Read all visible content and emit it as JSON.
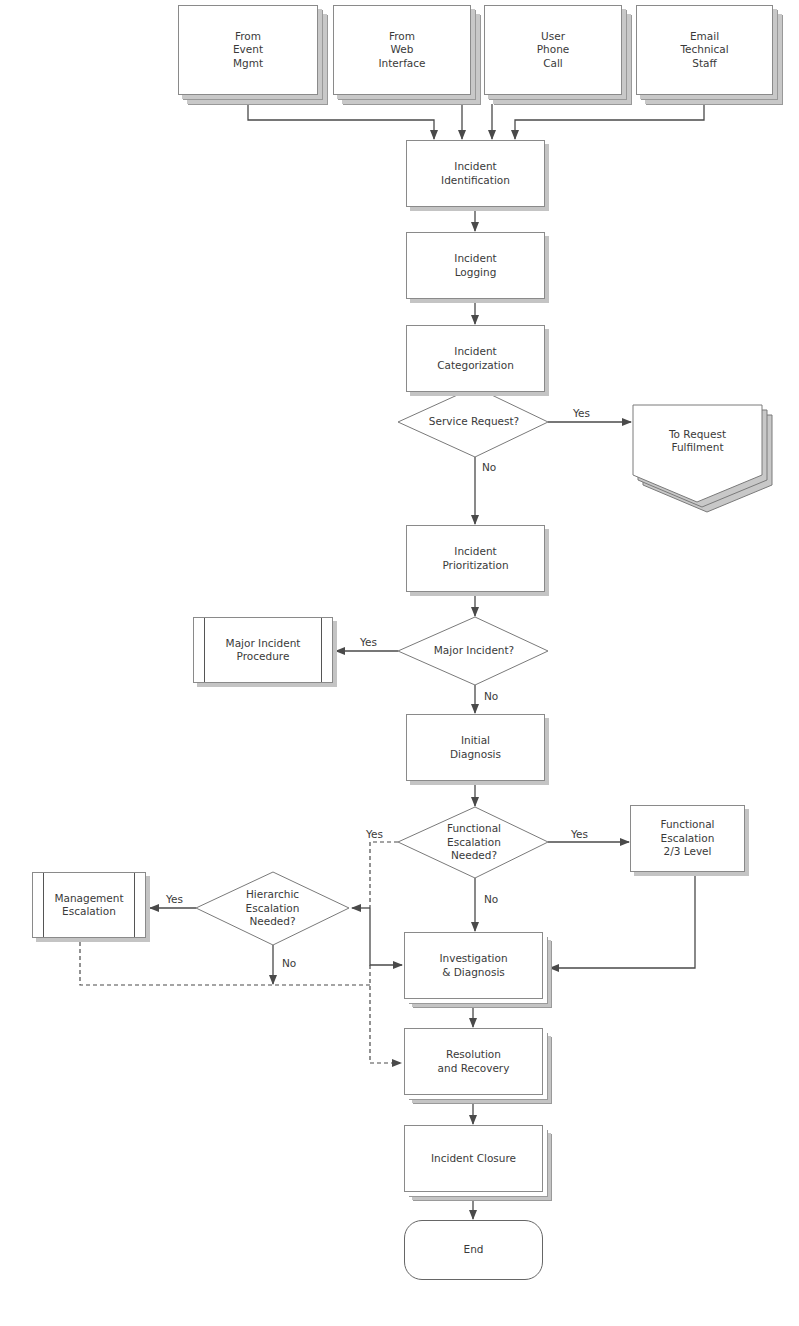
{
  "heading_fragment": "… ________ _ ___ …",
  "colors": {
    "line": "#4a4a4a",
    "border": "#8a8a8a",
    "shadow": "#c4c4c4",
    "text": "#3a3a3a"
  },
  "inputs": [
    {
      "id": "event",
      "label": "From\nEvent\nMgmt"
    },
    {
      "id": "web",
      "label": "From\nWeb\nInterface"
    },
    {
      "id": "phone",
      "label": "User\nPhone\nCall"
    },
    {
      "id": "email",
      "label": "Email\nTechnical\nStaff"
    }
  ],
  "process": {
    "identification": "Incident\nIdentification",
    "logging": "Incident\nLogging",
    "categorization": "Incident\nCategorization",
    "prioritization": "Incident\nPrioritization",
    "initial_diagnosis": "Initial\nDiagnosis",
    "investigation": "Investigation\n& Diagnosis",
    "resolution": "Resolution\nand Recovery",
    "closure": "Incident Closure",
    "end": "End"
  },
  "decisions": {
    "service_request": "Service Request?",
    "major_incident": "Major Incident?",
    "functional_escalation": "Functional\nEscalation\nNeeded?",
    "hierarchic_escalation": "Hierarchic\nEscalation\nNeeded?"
  },
  "external": {
    "request_fulfilment": "To Request\nFulfilment",
    "major_incident_procedure": "Major Incident\nProcedure",
    "functional_escalation_level": "Functional\nEscalation\n2/3 Level",
    "management_escalation": "Management\nEscalation"
  },
  "edge_labels": {
    "yes": "Yes",
    "no": "No"
  }
}
